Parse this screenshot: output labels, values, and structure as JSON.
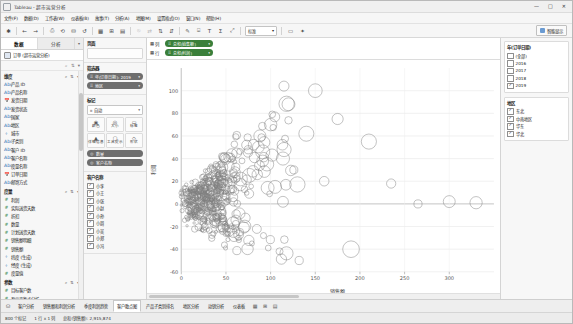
{
  "window": {
    "title": "Tableau - 超市运营分析",
    "app_icon": "tableau-icon",
    "minimize": "—",
    "maximize": "□",
    "close": "✕"
  },
  "menu": {
    "items": [
      {
        "label": "文件(F)"
      },
      {
        "label": "数据(D)"
      },
      {
        "label": "工作表(W)"
      },
      {
        "label": "仪表板(B)"
      },
      {
        "label": "故事(T)"
      },
      {
        "label": "分析(A)"
      },
      {
        "label": "地图(M)"
      },
      {
        "label": "设置格式(O)"
      },
      {
        "label": "窗口(N)"
      },
      {
        "label": "帮助(H)"
      }
    ]
  },
  "toolbar": {
    "buttons": [
      {
        "name": "tableau-logo-icon",
        "glyph": "✱"
      },
      {
        "name": "back-icon",
        "glyph": "←"
      },
      {
        "name": "forward-icon",
        "glyph": "→"
      },
      {
        "name": "save-icon",
        "glyph": "⎙"
      },
      {
        "name": "refresh-data-source-icon",
        "glyph": "⟲"
      },
      {
        "name": "new-data-source-icon",
        "glyph": "⛁"
      },
      {
        "name": "undo-icon",
        "glyph": "↺"
      },
      {
        "name": "new-worksheet-icon",
        "glyph": "▦"
      },
      {
        "name": "new-dashboard-icon",
        "glyph": "⊞"
      },
      {
        "name": "new-story-icon",
        "glyph": "▤"
      },
      {
        "name": "clear-sheet-icon",
        "glyph": "⦸"
      },
      {
        "name": "swap-rows-columns-icon",
        "glyph": "⇄"
      },
      {
        "name": "sort-ascending-icon",
        "glyph": "⇅"
      },
      {
        "name": "sort-descending-icon",
        "glyph": "⇵"
      },
      {
        "name": "highlight-icon",
        "glyph": "✎"
      },
      {
        "name": "group-members-icon",
        "glyph": "⌸"
      },
      {
        "name": "show-labels-icon",
        "glyph": "T"
      },
      {
        "name": "totals-icon",
        "glyph": "Σ"
      },
      {
        "name": "fix-axes-icon",
        "glyph": "⤢"
      }
    ],
    "fit_value": "标准",
    "presentation_icon": "presentation-mode-icon",
    "show_me_label": "智能显示",
    "show_me_icon": "show-me-icon"
  },
  "left_pane": {
    "tabs": [
      {
        "label": "数据",
        "active": true
      },
      {
        "label": "分析",
        "active": false
      }
    ],
    "datasource": "订单 (超市运营分析)",
    "dimensions_header": "维度",
    "dimensions": [
      {
        "label": "产品 ID",
        "type": "Abc"
      },
      {
        "label": "产品名称",
        "type": "Abc"
      },
      {
        "label": "发货日期",
        "type": "📅"
      },
      {
        "label": "发货状态",
        "type": "Abc"
      },
      {
        "label": "国家",
        "type": "Abc"
      },
      {
        "label": "地区",
        "type": "Abc"
      },
      {
        "label": "城市",
        "type": "⌖"
      },
      {
        "label": "子类别",
        "type": "Abc"
      },
      {
        "label": "客户 ID",
        "type": "Abc"
      },
      {
        "label": "客户名称",
        "type": "Abc"
      },
      {
        "label": "度量名称",
        "type": "Abc"
      },
      {
        "label": "订单日期",
        "type": "📅"
      },
      {
        "label": "邮寄方式",
        "type": "Abc"
      }
    ],
    "measures_header": "度量",
    "measures": [
      {
        "label": "利润",
        "type": "#"
      },
      {
        "label": "实际送货天数",
        "type": "#"
      },
      {
        "label": "折扣",
        "type": "#"
      },
      {
        "label": "数量",
        "type": "#"
      },
      {
        "label": "计划送货天数",
        "type": "#"
      },
      {
        "label": "销售额明细",
        "type": "#"
      },
      {
        "label": "销售额",
        "type": "#"
      },
      {
        "label": "纬度 (生成)",
        "type": "⌖"
      },
      {
        "label": "经度 (生成)",
        "type": "⌖"
      },
      {
        "label": "度量值",
        "type": "#"
      }
    ],
    "parameters_header": "参数",
    "parameters": [
      {
        "label": "目标客户数",
        "type": "#"
      },
      {
        "label": "盈亏平衡点分析",
        "type": "#"
      },
      {
        "label": "利润率",
        "type": "#"
      }
    ]
  },
  "cards": {
    "pages_title": "页面",
    "pages_dropzone": "",
    "filters_title": "筛选器",
    "filters": [
      {
        "label": "年(订单日期): 2019"
      },
      {
        "label": "地区"
      }
    ],
    "marks_title": "标记",
    "marks_type": "自动",
    "marks_type_icon": "automatic-mark-icon",
    "mark_buttons": [
      {
        "label": "颜色",
        "icon": "color-icon",
        "glyph": "◉"
      },
      {
        "label": "大小",
        "icon": "size-icon",
        "glyph": "◎"
      },
      {
        "label": "标签",
        "icon": "label-icon",
        "glyph": "▭"
      },
      {
        "label": "详细信息",
        "icon": "detail-icon",
        "glyph": "▲"
      },
      {
        "label": "工具提示",
        "icon": "tooltip-icon",
        "glyph": "▢"
      },
      {
        "label": "形状",
        "icon": "shape-icon",
        "glyph": "◇"
      }
    ],
    "mark_pills": [
      {
        "label": "数量",
        "icon": "size-icon"
      },
      {
        "label": "客户名称",
        "icon": "detail-icon"
      }
    ],
    "detail_list_title": "客户名称",
    "detail_items": [
      {
        "label": "小李"
      },
      {
        "label": "小王"
      },
      {
        "label": "小张"
      },
      {
        "label": "小赵"
      },
      {
        "label": "小孙"
      },
      {
        "label": "小周"
      },
      {
        "label": "小吴"
      },
      {
        "label": "小郑"
      },
      {
        "label": "小冯"
      }
    ],
    "legend_title": "颜色",
    "legend_items": [
      {
        "label": "东北"
      },
      {
        "label": "华东"
      },
      {
        "label": "华北"
      },
      {
        "label": "中南"
      }
    ]
  },
  "shelves": {
    "columns_label": "列",
    "columns_pills": [
      {
        "label": "总和(销售额)"
      }
    ],
    "rows_label": "行",
    "rows_pills": [
      {
        "label": "总和(利润)"
      }
    ]
  },
  "chart_data": {
    "type": "scatter",
    "title": "",
    "xlabel": "销售额",
    "ylabel": "利润",
    "xlim": [
      0,
      350
    ],
    "ylim": [
      -60,
      120
    ],
    "xticks": [
      0,
      50,
      100,
      150,
      200,
      250,
      300
    ],
    "yticks": [
      -60,
      -40,
      -20,
      0,
      20,
      40,
      60,
      80,
      100
    ],
    "grid": true,
    "legend_position": "right",
    "mark_shape": "open-circle",
    "mark_color": "#808080",
    "points": [
      {
        "x": 5,
        "y": 2,
        "s": 3
      },
      {
        "x": 6,
        "y": 4,
        "s": 4
      },
      {
        "x": 7,
        "y": -2,
        "s": 3
      },
      {
        "x": 8,
        "y": 6,
        "s": 5
      },
      {
        "x": 9,
        "y": 1,
        "s": 3
      },
      {
        "x": 10,
        "y": -5,
        "s": 4
      },
      {
        "x": 11,
        "y": 8,
        "s": 4
      },
      {
        "x": 12,
        "y": 3,
        "s": 6
      },
      {
        "x": 13,
        "y": -8,
        "s": 3
      },
      {
        "x": 14,
        "y": 10,
        "s": 5
      },
      {
        "x": 15,
        "y": 0,
        "s": 4
      },
      {
        "x": 16,
        "y": 5,
        "s": 7
      },
      {
        "x": 17,
        "y": -3,
        "s": 4
      },
      {
        "x": 18,
        "y": 12,
        "s": 5
      },
      {
        "x": 19,
        "y": 7,
        "s": 4
      },
      {
        "x": 20,
        "y": -12,
        "s": 5
      },
      {
        "x": 21,
        "y": 2,
        "s": 8
      },
      {
        "x": 22,
        "y": 15,
        "s": 5
      },
      {
        "x": 23,
        "y": -6,
        "s": 4
      },
      {
        "x": 24,
        "y": 9,
        "s": 6
      },
      {
        "x": 25,
        "y": 4,
        "s": 5
      },
      {
        "x": 26,
        "y": 18,
        "s": 6
      },
      {
        "x": 27,
        "y": -10,
        "s": 5
      },
      {
        "x": 28,
        "y": 6,
        "s": 7
      },
      {
        "x": 29,
        "y": 11,
        "s": 5
      },
      {
        "x": 30,
        "y": -15,
        "s": 6
      },
      {
        "x": 31,
        "y": 3,
        "s": 5
      },
      {
        "x": 32,
        "y": 20,
        "s": 7
      },
      {
        "x": 33,
        "y": -4,
        "s": 5
      },
      {
        "x": 34,
        "y": 14,
        "s": 6
      },
      {
        "x": 35,
        "y": 8,
        "s": 9
      },
      {
        "x": 36,
        "y": -18,
        "s": 5
      },
      {
        "x": 37,
        "y": 22,
        "s": 6
      },
      {
        "x": 38,
        "y": 1,
        "s": 7
      },
      {
        "x": 39,
        "y": 16,
        "s": 5
      },
      {
        "x": 40,
        "y": -9,
        "s": 8
      },
      {
        "x": 41,
        "y": 25,
        "s": 6
      },
      {
        "x": 42,
        "y": 5,
        "s": 7
      },
      {
        "x": 43,
        "y": -22,
        "s": 6
      },
      {
        "x": 44,
        "y": 19,
        "s": 8
      },
      {
        "x": 45,
        "y": 10,
        "s": 6
      },
      {
        "x": 46,
        "y": 30,
        "s": 7
      },
      {
        "x": 47,
        "y": -13,
        "s": 6
      },
      {
        "x": 48,
        "y": 24,
        "s": 9
      },
      {
        "x": 50,
        "y": 7,
        "s": 7
      },
      {
        "x": 52,
        "y": -26,
        "s": 6
      },
      {
        "x": 54,
        "y": 33,
        "s": 8
      },
      {
        "x": 56,
        "y": 13,
        "s": 7
      },
      {
        "x": 58,
        "y": -17,
        "s": 9
      },
      {
        "x": 60,
        "y": 28,
        "s": 8
      },
      {
        "x": 62,
        "y": 45,
        "s": 7
      },
      {
        "x": 64,
        "y": -30,
        "s": 7
      },
      {
        "x": 66,
        "y": 17,
        "s": 10
      },
      {
        "x": 68,
        "y": 38,
        "s": 8
      },
      {
        "x": 70,
        "y": -21,
        "s": 8
      },
      {
        "x": 73,
        "y": 52,
        "s": 9
      },
      {
        "x": 76,
        "y": 9,
        "s": 8
      },
      {
        "x": 79,
        "y": -35,
        "s": 9
      },
      {
        "x": 82,
        "y": 41,
        "s": 10
      },
      {
        "x": 85,
        "y": 26,
        "s": 9
      },
      {
        "x": 88,
        "y": 60,
        "s": 9
      },
      {
        "x": 92,
        "y": -28,
        "s": 10
      },
      {
        "x": 96,
        "y": 35,
        "s": 11
      },
      {
        "x": 100,
        "y": 70,
        "s": 10
      },
      {
        "x": 105,
        "y": 15,
        "s": 10
      },
      {
        "x": 110,
        "y": -42,
        "s": 10
      },
      {
        "x": 115,
        "y": 48,
        "s": 12
      },
      {
        "x": 120,
        "y": 88,
        "s": 11
      },
      {
        "x": 126,
        "y": 30,
        "s": 11
      },
      {
        "x": 132,
        "y": -50,
        "s": 11
      },
      {
        "x": 140,
        "y": 62,
        "s": 13
      },
      {
        "x": 150,
        "y": 100,
        "s": 12
      },
      {
        "x": 160,
        "y": 20,
        "s": 12
      },
      {
        "x": 175,
        "y": 75,
        "s": 14
      },
      {
        "x": 190,
        "y": -40,
        "s": 13
      },
      {
        "x": 210,
        "y": 55,
        "s": 14
      },
      {
        "x": 235,
        "y": 18,
        "s": 15
      },
      {
        "x": 265,
        "y": 0,
        "s": 13
      },
      {
        "x": 300,
        "y": 2,
        "s": 12
      },
      {
        "x": 330,
        "y": 1,
        "s": 11
      }
    ]
  },
  "year_filter": {
    "title": "年(订单日期)",
    "options": [
      {
        "label": "(全部)",
        "checked": false
      },
      {
        "label": "2016",
        "checked": false
      },
      {
        "label": "2017",
        "checked": false
      },
      {
        "label": "2018",
        "checked": false
      },
      {
        "label": "2019",
        "checked": true
      }
    ]
  },
  "region_filter": {
    "title": "地区",
    "options": [
      {
        "label": "东北",
        "checked": true
      },
      {
        "label": "中南地区",
        "checked": true
      },
      {
        "label": "华东",
        "checked": true
      },
      {
        "label": "华北",
        "checked": true
      }
    ]
  },
  "bottom": {
    "icons": [
      {
        "name": "data-source-tab-icon",
        "glyph": "⛁",
        "label": "数据源"
      }
    ],
    "tabs": [
      {
        "label": "客户分析",
        "active": false
      },
      {
        "label": "销售额和利润分析",
        "active": false
      },
      {
        "label": "季度利润趋势",
        "active": false
      },
      {
        "label": "客户散点图",
        "active": true
      },
      {
        "label": "产品子类别排名",
        "active": false
      },
      {
        "label": "地区分析",
        "active": false
      },
      {
        "label": "动销分析",
        "active": false
      },
      {
        "label": "仪表板",
        "active": false
      }
    ],
    "new_sheet_icon": "new-worksheet-icon",
    "new_dashboard_icon": "new-dashboard-icon",
    "new_story_icon": "new-story-icon"
  },
  "status": {
    "marks": "800 个标记",
    "rows_cols": "1 行 x 1 列",
    "sum": "总和(销售额): 2,915,874"
  }
}
